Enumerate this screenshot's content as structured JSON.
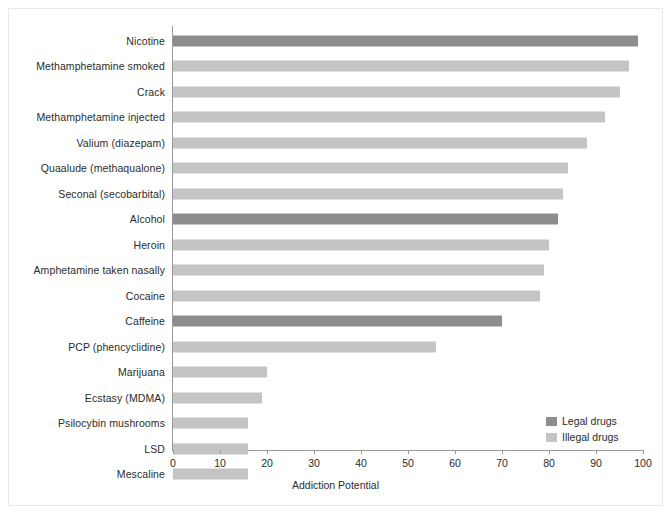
{
  "chart_data": {
    "type": "bar",
    "orientation": "horizontal",
    "title": "",
    "xlabel": "Addiction Potential",
    "ylabel": "",
    "xlim": [
      0,
      100
    ],
    "xticks": [
      "0",
      "10",
      "20",
      "30",
      "40",
      "50",
      "60",
      "70",
      "80",
      "90",
      "100"
    ],
    "grid": false,
    "legend_position": "bottom-right",
    "categories": [
      "Nicotine",
      "Methamphetamine smoked",
      "Crack",
      "Methamphetamine injected",
      "Valium (diazepam)",
      "Quaalude (methaqualone)",
      "Seconal (secobarbital)",
      "Alcohol",
      "Heroin",
      "Amphetamine taken nasally",
      "Cocaine",
      "Caffeine",
      "PCP (phencyclidine)",
      "Marijuana",
      "Ecstasy (MDMA)",
      "Psilocybin mushrooms",
      "LSD",
      "Mescaline"
    ],
    "values": [
      99,
      97,
      95,
      92,
      88,
      84,
      83,
      82,
      80,
      79,
      78,
      70,
      56,
      20,
      19,
      16,
      16,
      16
    ],
    "groups": [
      "legal",
      "illegal",
      "illegal",
      "illegal",
      "illegal",
      "illegal",
      "illegal",
      "legal",
      "illegal",
      "illegal",
      "illegal",
      "legal",
      "illegal",
      "illegal",
      "illegal",
      "illegal",
      "illegal",
      "illegal"
    ],
    "series": [
      {
        "name": "Legal drugs",
        "key": "legal",
        "color": "#8d8d8d",
        "points": [
          {
            "category": "Nicotine",
            "value": 99
          },
          {
            "category": "Alcohol",
            "value": 82
          },
          {
            "category": "Caffeine",
            "value": 70
          }
        ]
      },
      {
        "name": "Illegal drugs",
        "key": "illegal",
        "color": "#c4c4c4",
        "points": [
          {
            "category": "Methamphetamine smoked",
            "value": 97
          },
          {
            "category": "Crack",
            "value": 95
          },
          {
            "category": "Methamphetamine injected",
            "value": 92
          },
          {
            "category": "Valium (diazepam)",
            "value": 88
          },
          {
            "category": "Quaalude (methaqualone)",
            "value": 84
          },
          {
            "category": "Seconal (secobarbital)",
            "value": 83
          },
          {
            "category": "Heroin",
            "value": 80
          },
          {
            "category": "Amphetamine taken nasally",
            "value": 79
          },
          {
            "category": "Cocaine",
            "value": 78
          },
          {
            "category": "PCP (phencyclidine)",
            "value": 56
          },
          {
            "category": "Marijuana",
            "value": 20
          },
          {
            "category": "Ecstasy (MDMA)",
            "value": 19
          },
          {
            "category": "Psilocybin mushrooms",
            "value": 16
          },
          {
            "category": "LSD",
            "value": 16
          },
          {
            "category": "Mescaline",
            "value": 16
          }
        ]
      }
    ]
  },
  "legend": {
    "items": [
      {
        "label": "Legal drugs",
        "key": "legal"
      },
      {
        "label": "Illegal drugs",
        "key": "illegal"
      }
    ]
  },
  "colors": {
    "legal": "#8d8d8d",
    "illegal": "#c4c4c4",
    "axis": "#9a9a9a",
    "text": "#2b2b2b",
    "background": "#ffffff"
  }
}
